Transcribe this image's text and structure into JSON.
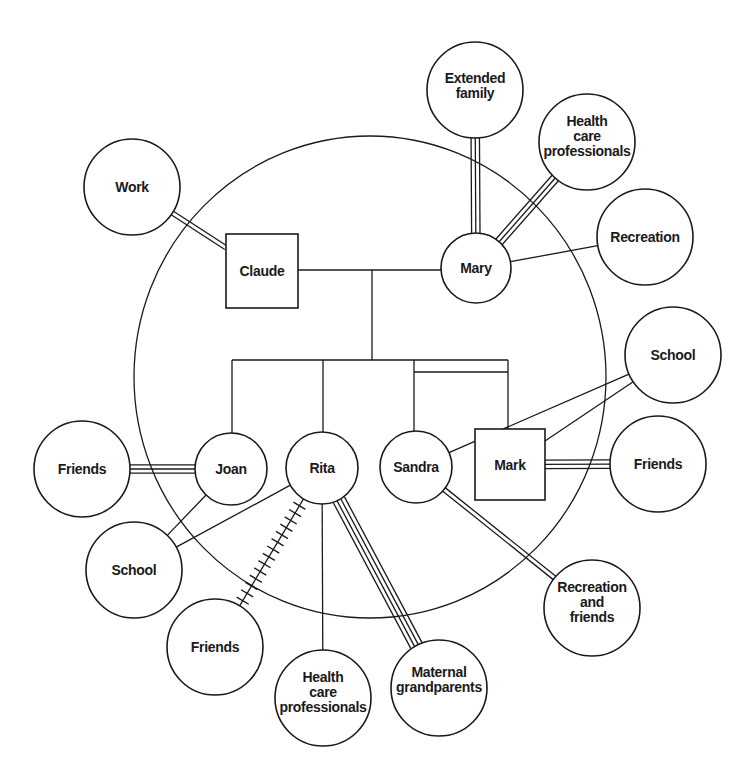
{
  "diagram": {
    "type": "ecomap",
    "colors": {
      "stroke": "#1a1a1a",
      "background": "#ffffff"
    },
    "household": {
      "cx": 370,
      "cy": 377,
      "rx": 236,
      "ry": 241
    },
    "family_members": [
      {
        "id": "claude",
        "label": "Claude",
        "shape": "square",
        "x": 226,
        "y": 234,
        "w": 72,
        "h": 74
      },
      {
        "id": "mary",
        "label": "Mary",
        "shape": "circle",
        "cx": 476,
        "cy": 268,
        "r": 35
      },
      {
        "id": "joan",
        "label": "Joan",
        "shape": "circle",
        "cx": 231,
        "cy": 469,
        "r": 36
      },
      {
        "id": "rita",
        "label": "Rita",
        "shape": "circle",
        "cx": 322,
        "cy": 468,
        "r": 36
      },
      {
        "id": "sandra",
        "label": "Sandra",
        "shape": "circle",
        "cx": 416,
        "cy": 467,
        "r": 36
      },
      {
        "id": "mark",
        "label": "Mark",
        "shape": "square",
        "x": 475,
        "y": 429,
        "w": 70,
        "h": 71
      }
    ],
    "external_systems": [
      {
        "id": "work",
        "lines": [
          "Work"
        ],
        "cx": 132,
        "cy": 187,
        "r": 48
      },
      {
        "id": "extended_family",
        "lines": [
          "Extended",
          "family"
        ],
        "cx": 475,
        "cy": 90,
        "r": 48
      },
      {
        "id": "health_care_top",
        "lines": [
          "Health",
          "care",
          "professionals"
        ],
        "cx": 587,
        "cy": 142,
        "r": 48
      },
      {
        "id": "recreation",
        "lines": [
          "Recreation"
        ],
        "cx": 645,
        "cy": 237,
        "r": 48
      },
      {
        "id": "school_right",
        "lines": [
          "School"
        ],
        "cx": 673,
        "cy": 355,
        "r": 48
      },
      {
        "id": "friends_right",
        "lines": [
          "Friends"
        ],
        "cx": 658,
        "cy": 464,
        "r": 48
      },
      {
        "id": "recreation_friends",
        "lines": [
          "Recreation",
          "and",
          "friends"
        ],
        "cx": 592,
        "cy": 608,
        "r": 48
      },
      {
        "id": "maternal_grandparents",
        "lines": [
          "Maternal",
          "grandparents"
        ],
        "cx": 439,
        "cy": 688,
        "r": 48
      },
      {
        "id": "health_care_bottom",
        "lines": [
          "Health",
          "care",
          "professionals"
        ],
        "cx": 323,
        "cy": 698,
        "r": 48
      },
      {
        "id": "friends_bottom",
        "lines": [
          "Friends"
        ],
        "cx": 215,
        "cy": 647,
        "r": 48
      },
      {
        "id": "school_left",
        "lines": [
          "School"
        ],
        "cx": 134,
        "cy": 570,
        "r": 48
      },
      {
        "id": "friends_left",
        "lines": [
          "Friends"
        ],
        "cx": 82,
        "cy": 469,
        "r": 48
      }
    ],
    "connections": [
      {
        "from": "work",
        "to": "claude",
        "kind": "strong",
        "lines": 2
      },
      {
        "from": "extended_family",
        "to": "mary",
        "kind": "strong",
        "lines": 3
      },
      {
        "from": "health_care_top",
        "to": "mary",
        "kind": "strong",
        "lines": 3
      },
      {
        "from": "recreation",
        "to": "mary",
        "kind": "normal",
        "lines": 1
      },
      {
        "from": "school_right",
        "to": "sandra",
        "kind": "normal",
        "lines": 1
      },
      {
        "from": "school_right",
        "to": "mark",
        "kind": "normal",
        "lines": 1
      },
      {
        "from": "friends_right",
        "to": "mark",
        "kind": "strong",
        "lines": 3
      },
      {
        "from": "recreation_friends",
        "to": "sandra",
        "kind": "strong",
        "lines": 2
      },
      {
        "from": "maternal_grandparents",
        "to": "rita",
        "kind": "strong",
        "lines": 4
      },
      {
        "from": "health_care_bottom",
        "to": "rita",
        "kind": "normal",
        "lines": 1
      },
      {
        "from": "friends_bottom",
        "to": "rita",
        "kind": "stressful",
        "lines": 1
      },
      {
        "from": "school_left",
        "to": "rita",
        "kind": "normal",
        "lines": 1
      },
      {
        "from": "school_left",
        "to": "joan",
        "kind": "normal",
        "lines": 1
      },
      {
        "from": "friends_left",
        "to": "joan",
        "kind": "strong",
        "lines": 3
      }
    ],
    "genogram": {
      "marriage_line_y": 270,
      "drop_x": 372,
      "sibling_line_y": 360,
      "children_x": {
        "joan": 232,
        "rita": 323,
        "twin_split": 414,
        "twins_right": 508
      },
      "twin_bar_y": 372,
      "twins": [
        "sandra",
        "mark"
      ]
    }
  }
}
